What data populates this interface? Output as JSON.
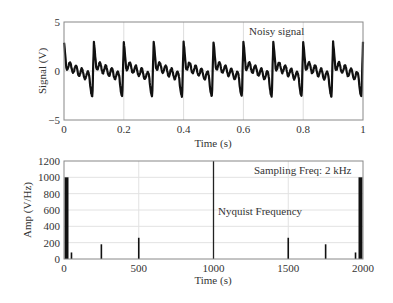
{
  "chart_data": [
    {
      "type": "line",
      "title": "",
      "annotation": "Noisy signal",
      "xlabel": "Time (s)",
      "ylabel": "Signal (V)",
      "xlim": [
        0,
        1
      ],
      "ylim": [
        -5,
        5
      ],
      "xticks": [
        0,
        0.2,
        0.4,
        0.6,
        0.8,
        1
      ],
      "xtick_labels": [
        "0",
        "0.2",
        "0.4",
        "0.6",
        "0.8",
        "1"
      ],
      "yticks": [
        -5,
        0,
        5
      ],
      "ytick_labels": [
        "−5",
        "0",
        "5"
      ],
      "grid": true,
      "line_color": "#111111",
      "signal_components": [
        {
          "freq_hz": 10,
          "amplitude": 1.0,
          "phase_deg": 90
        },
        {
          "freq_hz": 50,
          "amplitude": 0.55,
          "phase_deg": 90
        },
        {
          "freq_hz": 250,
          "amplitude": 0.35,
          "phase_deg": 0
        },
        {
          "freq_hz": 500,
          "amplitude": 0.5,
          "phase_deg": 0
        }
      ],
      "noise_amplitude": 0.25,
      "approx_range": [
        -2.8,
        2.6
      ]
    },
    {
      "type": "bar",
      "title": "",
      "annotations": [
        "Sampling Freq: 2 kHz",
        "Nyquist Frequency"
      ],
      "xlabel": "Time (s)",
      "ylabel": "Amp (V/Hz)",
      "xlim": [
        0,
        2000
      ],
      "ylim": [
        0,
        1200
      ],
      "xticks": [
        0,
        500,
        1000,
        1500,
        2000
      ],
      "xtick_labels": [
        "0",
        "500",
        "1000",
        "1500",
        "2000"
      ],
      "yticks": [
        0,
        200,
        400,
        600,
        800,
        1000,
        1200
      ],
      "ytick_labels": [
        "0",
        "200",
        "400",
        "600",
        "800",
        "1000",
        "1200"
      ],
      "grid": true,
      "nyquist_line_x": 1000,
      "bar_color": "#111111",
      "x": [
        10,
        50,
        250,
        500,
        1500,
        1750,
        1950,
        1990
      ],
      "values": [
        1000,
        80,
        180,
        260,
        260,
        180,
        80,
        1000
      ]
    }
  ]
}
